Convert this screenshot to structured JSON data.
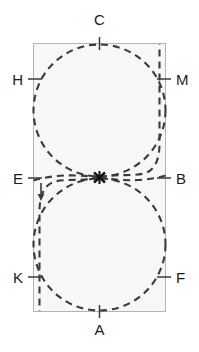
{
  "figure": {
    "type": "geometry-diagram",
    "title": "",
    "canvas": {
      "width": 199,
      "height": 352,
      "background": "#ffffff"
    },
    "rectangle": {
      "x": 33,
      "y": 43,
      "width": 133,
      "height": 269,
      "fill": "#f7f7f7",
      "stroke": "#b4b4b4",
      "stroke_width": 1
    },
    "colors": {
      "curve": "#3a3a3a",
      "rect_stroke": "#b4b4b4",
      "rect_fill": "#f7f7f7",
      "label_text": "#1b1b1b",
      "tick": "#3a3a3a"
    },
    "style": {
      "dash_pattern": "7 5",
      "curve_width": 2.1
    },
    "circles": [
      {
        "name": "upper-circle",
        "cx": 99.5,
        "cy": 110.5,
        "r": 66.5
      },
      {
        "name": "lower-circle",
        "cx": 99.5,
        "cy": 244.5,
        "r": 66.5
      }
    ],
    "crossing_point": {
      "label": "X",
      "x": 99.5,
      "y": 177.5
    },
    "labels": [
      {
        "id": "C",
        "text": "C",
        "x": 99.5,
        "y": 27,
        "anchor": "top",
        "tick": {
          "x1": 99.5,
          "y1": 37,
          "x2": 99.5,
          "y2": 50
        }
      },
      {
        "id": "H",
        "text": "H",
        "x": 23,
        "y": 79,
        "anchor": "left",
        "tick": {
          "x1": 28,
          "y1": 79,
          "x2": 42,
          "y2": 79
        }
      },
      {
        "id": "M",
        "text": "M",
        "x": 176,
        "y": 79,
        "anchor": "right",
        "tick": {
          "x1": 157,
          "y1": 79,
          "x2": 171,
          "y2": 79
        }
      },
      {
        "id": "E",
        "text": "E",
        "x": 23,
        "y": 178,
        "anchor": "left",
        "tick": {
          "x1": 28,
          "y1": 178,
          "x2": 42,
          "y2": 178
        }
      },
      {
        "id": "B",
        "text": "B",
        "x": 176,
        "y": 178,
        "anchor": "right",
        "tick": {
          "x1": 157,
          "y1": 178,
          "x2": 171,
          "y2": 178
        }
      },
      {
        "id": "K",
        "text": "K",
        "x": 23,
        "y": 277,
        "anchor": "left",
        "tick": {
          "x1": 28,
          "y1": 277,
          "x2": 42,
          "y2": 277
        }
      },
      {
        "id": "F",
        "text": "F",
        "x": 176,
        "y": 277,
        "anchor": "right",
        "tick": {
          "x1": 157,
          "y1": 277,
          "x2": 171,
          "y2": 277
        }
      },
      {
        "id": "A",
        "text": "A",
        "x": 99.5,
        "y": 322,
        "anchor": "bottom",
        "tick": {
          "x1": 99.5,
          "y1": 305,
          "x2": 99.5,
          "y2": 318
        }
      },
      {
        "id": "X",
        "text": "X",
        "x": 99.5,
        "y": 177.5,
        "anchor": "center",
        "tick": null
      }
    ],
    "arrow": {
      "name": "direction-arrow",
      "x": 41,
      "y_start": 184,
      "y_end": 200,
      "direction": "down"
    },
    "paths": {
      "upper_tail": "M 99.5 177.5 C 118 174 134 176 146 173 C 158 170 160 158 160 143 L 160 43",
      "lower_tail": "M 99.5 177.5 C 81 181 65 179 53 182 C 41 185 39 196 39 211 L 39 312",
      "left_branch_upper": "M 33 180 C 52 175 72 174 99.5 177.5",
      "right_branch_lower": "M 166 176 C 147 180 127 181 99.5 177.5"
    }
  }
}
